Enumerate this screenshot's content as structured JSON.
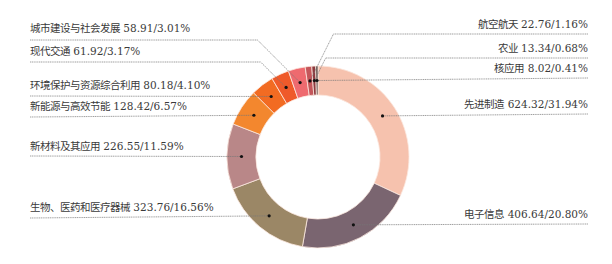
{
  "chart_data": {
    "type": "pie",
    "subtype": "donut",
    "title": "",
    "unit_note": "value / percent",
    "start_angle": "12 o'clock, clockwise",
    "slices": [
      {
        "label": "先进制造",
        "value": 624.32,
        "percent": 31.94,
        "color": "#f6c2ae",
        "side": "right",
        "text": "先进制造 624.32/31.94%"
      },
      {
        "label": "电子信息",
        "value": 406.64,
        "percent": 20.8,
        "color": "#7a6570",
        "side": "right",
        "text": "电子信息 406.64/20.80%"
      },
      {
        "label": "生物、医药和医疗器械",
        "value": 323.76,
        "percent": 16.56,
        "color": "#9b8766",
        "side": "left",
        "text": "生物、医药和医疗器械 323.76/16.56%"
      },
      {
        "label": "新材料及其应用",
        "value": 226.55,
        "percent": 11.59,
        "color": "#b98788",
        "side": "left",
        "text": "新材料及其应用 226.55/11.59%"
      },
      {
        "label": "新能源与高效节能",
        "value": 128.42,
        "percent": 6.57,
        "color": "#f3872e",
        "side": "left",
        "text": "新能源与高效节能 128.42/6.57%"
      },
      {
        "label": "环境保护与资源综合利用",
        "value": 80.18,
        "percent": 4.1,
        "color": "#f26b22",
        "side": "left",
        "text": "环境保护与资源综合利用 80.18/4.10%"
      },
      {
        "label": "现代交通",
        "value": 61.92,
        "percent": 3.17,
        "color": "#ef5a2a",
        "side": "left",
        "text": "现代交通 61.92/3.17%"
      },
      {
        "label": "城市建设与社会发展",
        "value": 58.91,
        "percent": 3.01,
        "color": "#ee6a6f",
        "side": "left",
        "text": "城市建设与社会发展 58.91/3.01%"
      },
      {
        "label": "航空航天",
        "value": 22.76,
        "percent": 1.16,
        "color": "#c4565a",
        "side": "right",
        "text": "航空航天 22.76/1.16%"
      },
      {
        "label": "农业",
        "value": 13.34,
        "percent": 0.68,
        "color": "#8d3a3f",
        "side": "right",
        "text": "农业 13.34/0.68%"
      },
      {
        "label": "核应用",
        "value": 8.02,
        "percent": 0.41,
        "color": "#5b4a45",
        "side": "right",
        "text": "核应用 8.02/0.41%"
      }
    ],
    "legend": "callout labels with leader lines"
  },
  "layout": {
    "center": [
      318,
      157
    ],
    "outer_r": 91,
    "inner_r": 62,
    "labels": [
      {
        "idx": 7,
        "x": 30,
        "y": 22,
        "line_y": 40,
        "side": "left"
      },
      {
        "idx": 6,
        "x": 30,
        "y": 45,
        "line_y": 62,
        "side": "left"
      },
      {
        "idx": 5,
        "x": 30,
        "y": 79,
        "line_y": 96,
        "side": "left"
      },
      {
        "idx": 4,
        "x": 30,
        "y": 100,
        "line_y": 117,
        "side": "left"
      },
      {
        "idx": 3,
        "x": 30,
        "y": 140,
        "line_y": 156,
        "side": "left"
      },
      {
        "idx": 2,
        "x": 30,
        "y": 201,
        "line_y": 218,
        "side": "left"
      },
      {
        "idx": 8,
        "x": 588,
        "y": 18,
        "line_y": 34,
        "side": "right"
      },
      {
        "idx": 9,
        "x": 588,
        "y": 42,
        "line_y": 58,
        "side": "right"
      },
      {
        "idx": 10,
        "x": 588,
        "y": 62,
        "line_y": 78,
        "side": "right"
      },
      {
        "idx": 0,
        "x": 588,
        "y": 98,
        "line_y": 114,
        "side": "right"
      },
      {
        "idx": 1,
        "x": 588,
        "y": 208,
        "line_y": 224,
        "side": "right"
      }
    ]
  }
}
